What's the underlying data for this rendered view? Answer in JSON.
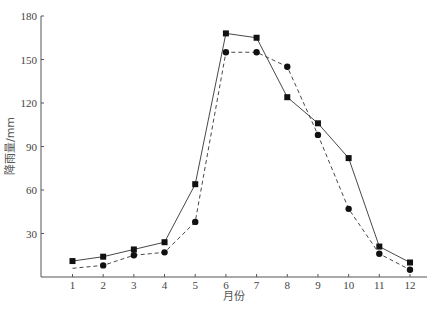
{
  "chart_data": {
    "type": "line",
    "title": "",
    "xlabel": "月份",
    "ylabel": "降雨量/mm",
    "categories": [
      "1",
      "2",
      "3",
      "4",
      "5",
      "6",
      "7",
      "8",
      "9",
      "10",
      "11",
      "12"
    ],
    "x": [
      1,
      2,
      3,
      4,
      5,
      6,
      7,
      8,
      9,
      10,
      11,
      12
    ],
    "series": [
      {
        "name": "series-1 (solid, square markers)",
        "style": "solid",
        "marker": "square",
        "values": [
          11,
          14,
          19,
          24,
          64,
          168,
          165,
          124,
          106,
          82,
          21,
          10
        ]
      },
      {
        "name": "series-2 (dashed, circle markers)",
        "style": "dashed",
        "marker": "circle",
        "values": [
          6,
          8,
          15,
          17,
          38,
          155,
          155,
          145,
          98,
          47,
          16,
          5
        ]
      }
    ],
    "ylim": [
      0,
      180
    ],
    "yticks": [
      30,
      60,
      90,
      120,
      150,
      180
    ],
    "xticks": [
      1,
      2,
      3,
      4,
      5,
      6,
      7,
      8,
      9,
      10,
      11,
      12
    ],
    "grid": false,
    "legend": "none"
  },
  "colors": {
    "axis": "#555555",
    "line": "#333333",
    "marker": "#111111"
  },
  "labels": {
    "x_axis_title": "月份",
    "y_axis_title": "降雨量/mm"
  }
}
